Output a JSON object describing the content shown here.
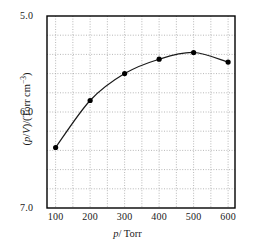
{
  "chart_data": {
    "type": "scatter",
    "title": "",
    "xlabel": "p/Torr",
    "ylabel": "(p/V)/(Torr cm−3)",
    "x": [
      100,
      200,
      300,
      400,
      500,
      600
    ],
    "values": [
      5.63,
      6.12,
      6.4,
      6.55,
      6.62,
      6.52
    ],
    "series": [
      {
        "name": "p/V vs p",
        "x": [
          100,
          200,
          300,
          400,
          500,
          600
        ],
        "values": [
          5.63,
          6.12,
          6.4,
          6.55,
          6.62,
          6.52
        ]
      }
    ],
    "xlim": [
      75,
      620
    ],
    "ylim": [
      5.0,
      7.0
    ],
    "xticks": [
      100,
      200,
      300,
      400,
      500,
      600
    ],
    "yticks": [
      5.0,
      6.0,
      7.0
    ],
    "y_minor_step": 0.2,
    "x_minor_step": 50,
    "grid": true,
    "legend": null,
    "marker": "filled-circle",
    "line": "smooth-curve"
  },
  "axes": {
    "y_tick_labels": [
      "7.0",
      "6.0",
      "5.0"
    ],
    "x_tick_labels": [
      "100",
      "200",
      "300",
      "400",
      "500",
      "600"
    ],
    "y_title_main": "(p/V)/(Torr cm",
    "y_title_sup": "−3",
    "y_title_tail": ")",
    "x_title_var": "p",
    "x_title_rest": "/ Torr"
  },
  "colors": {
    "axis": "#000000",
    "grid": "#999999",
    "curve": "#1a1a1a",
    "marker": "#000000",
    "background": "#ffffff"
  }
}
